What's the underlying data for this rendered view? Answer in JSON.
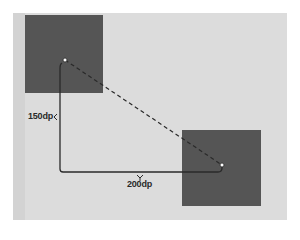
{
  "diagram": {
    "background_color": "#dcdcdc",
    "square_color": "#555555",
    "line_color": "#2a2a2a",
    "labels": {
      "vertical_distance": "150dp",
      "horizontal_distance": "200dp"
    },
    "elements": {
      "start_square": {
        "label": ""
      },
      "end_square": {
        "label": ""
      },
      "start_point": {
        "label": ""
      },
      "end_point": {
        "label": ""
      },
      "direct_path": {
        "style": "dashed"
      },
      "axis_path": {
        "style": "solid"
      }
    }
  }
}
